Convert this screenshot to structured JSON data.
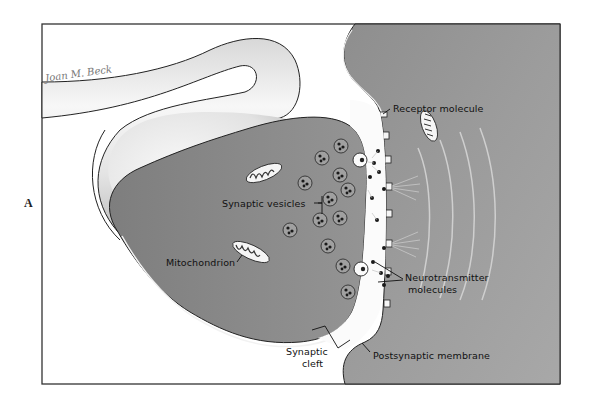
{
  "figure": {
    "panel_letter": "A",
    "signature": "Joan M. Beck",
    "colors": {
      "background": "#ffffff",
      "frame": "#333333",
      "presynaptic_fill": "#8c8c8c",
      "postsynaptic_fill": "#999999",
      "axon_highlight": "#f4f4f4",
      "axon_shadow": "#bdbdbd",
      "cleft_fill": "#fbfbfb",
      "line": "#1a1a1a"
    }
  },
  "labels": {
    "receptor_molecule": "Receptor molecule",
    "synaptic_vesicles": "Synaptic vesicles",
    "mitochondrion": "Mitochondrion",
    "neurotransmitter_line1": "Neurotransmitter",
    "neurotransmitter_line2": "molecules",
    "synaptic_cleft_line1": "Synaptic",
    "synaptic_cleft_line2": "cleft",
    "postsynaptic_membrane": "Postsynaptic membrane"
  }
}
